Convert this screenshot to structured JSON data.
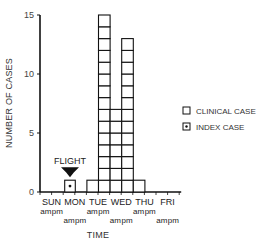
{
  "chart_data": {
    "type": "bar",
    "title": "",
    "xlabel": "TIME",
    "ylabel": "NUMBER OF CASES",
    "ylim": [
      0,
      15
    ],
    "yticks": [
      0,
      5,
      10,
      15
    ],
    "grid": false,
    "days": [
      "SUN",
      "MON",
      "TUE",
      "WED",
      "THU",
      "FRI"
    ],
    "half_day_labels": [
      "am",
      "pm"
    ],
    "categories": [
      "Sun am",
      "Sun pm",
      "Mon am",
      "Mon pm",
      "Tue am",
      "Tue pm",
      "Wed am",
      "Wed pm",
      "Thu am",
      "Thu pm",
      "Fri am",
      "Fri pm"
    ],
    "series": [
      {
        "name": "CLINICAL CASE",
        "values": [
          0,
          0,
          0,
          0,
          1,
          15,
          7,
          13,
          1,
          0,
          0,
          0
        ]
      },
      {
        "name": "INDEX CASE",
        "values": [
          0,
          0,
          1,
          0,
          0,
          0,
          0,
          0,
          0,
          0,
          0,
          0
        ]
      }
    ],
    "annotations": [
      {
        "text": "FLIGHT",
        "category": "Mon am",
        "type": "arrow-down"
      }
    ],
    "legend": {
      "placement": "right",
      "entries": [
        {
          "label": "CLINICAL CASE",
          "symbol": "empty-square"
        },
        {
          "label": "INDEX CASE",
          "symbol": "dotted-square"
        }
      ]
    }
  }
}
